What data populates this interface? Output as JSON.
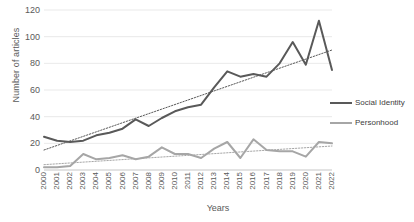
{
  "chart_data": {
    "type": "line",
    "title": "",
    "xlabel": "Years",
    "ylabel": "Number of articles",
    "grid": true,
    "legend_position": "right",
    "ylim": [
      0,
      120
    ],
    "yticks": [
      0,
      20,
      40,
      60,
      80,
      100,
      120
    ],
    "categories": [
      "2000",
      "2001",
      "2002",
      "2003",
      "2004",
      "2005",
      "2006",
      "2007",
      "2008",
      "2009",
      "2010",
      "2011",
      "2012",
      "2013",
      "2014",
      "2015",
      "2016",
      "2017",
      "2018",
      "2019",
      "2020",
      "2021",
      "2022"
    ],
    "series": [
      {
        "name": "Social Identity",
        "color": "#595959",
        "values": [
          25,
          22,
          21,
          22,
          26,
          28,
          31,
          38,
          33,
          39,
          44,
          47,
          49,
          62,
          74,
          70,
          72,
          70,
          80,
          96,
          79,
          112,
          75
        ],
        "trendline": {
          "style": "dotted",
          "start": 15,
          "end": 90
        }
      },
      {
        "name": "Personhood",
        "color": "#a6a6a6",
        "values": [
          2,
          2,
          3,
          12,
          8,
          9,
          11,
          8,
          10,
          17,
          12,
          12,
          9,
          16,
          21,
          9,
          23,
          15,
          14,
          14,
          10,
          21,
          20
        ],
        "trendline": {
          "style": "dotted",
          "start": 4,
          "end": 18
        }
      }
    ]
  },
  "legend": {
    "items": [
      {
        "label": "Social Identity",
        "color": "#595959"
      },
      {
        "label": "Personhood",
        "color": "#a6a6a6"
      }
    ]
  },
  "axes": {
    "y_title": "Number of articles",
    "x_title": "Years"
  }
}
